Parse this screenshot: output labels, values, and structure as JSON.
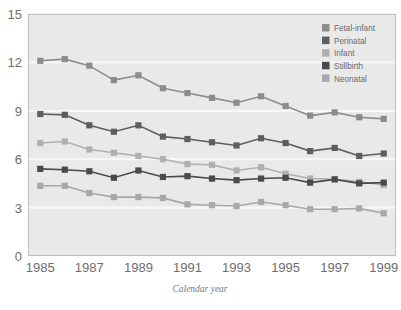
{
  "chart_data": {
    "type": "line",
    "title": "",
    "xlabel": "Calendar year",
    "ylabel": "",
    "x": [
      1985,
      1986,
      1987,
      1988,
      1989,
      1990,
      1991,
      1992,
      1993,
      1994,
      1995,
      1996,
      1997,
      1998,
      1999
    ],
    "xlim": [
      1984.5,
      1999.5
    ],
    "ylim": [
      0,
      15
    ],
    "xticks": [
      1985,
      1987,
      1989,
      1991,
      1993,
      1995,
      1997,
      1999
    ],
    "xtick_labels": [
      "1985",
      "1987",
      "1989",
      "1991",
      "1993",
      "1995",
      "1997",
      "1999"
    ],
    "yticks": [
      0,
      3,
      6,
      9,
      12,
      15
    ],
    "ytick_labels": [
      "0",
      "3",
      "6",
      "9",
      "12",
      "15"
    ],
    "grid": true,
    "grid_axis": "y",
    "legend_position": "top-right",
    "marker": "square",
    "series": [
      {
        "name": "Fetal-infant",
        "color": "#8c8c8c",
        "values": [
          12.1,
          12.2,
          11.8,
          10.9,
          11.2,
          10.4,
          10.1,
          9.8,
          9.5,
          9.9,
          9.3,
          8.7,
          8.9,
          8.6,
          8.5
        ]
      },
      {
        "name": "Perinatal",
        "color": "#5e5e5e",
        "values": [
          8.8,
          8.75,
          8.1,
          7.7,
          8.1,
          7.4,
          7.25,
          7.05,
          6.85,
          7.3,
          7.0,
          6.5,
          6.7,
          6.2,
          6.35
        ]
      },
      {
        "name": "Infant",
        "color": "#b0b0b0",
        "values": [
          7.0,
          7.1,
          6.6,
          6.4,
          6.2,
          6.0,
          5.7,
          5.65,
          5.3,
          5.5,
          5.1,
          4.8,
          4.75,
          4.6,
          4.4
        ]
      },
      {
        "name": "Stillbirth",
        "color": "#4a4a4a",
        "values": [
          5.4,
          5.35,
          5.25,
          4.85,
          5.3,
          4.9,
          4.95,
          4.8,
          4.7,
          4.8,
          4.85,
          4.55,
          4.75,
          4.5,
          4.55
        ]
      },
      {
        "name": "Neonatal",
        "color": "#a8a8a8",
        "values": [
          4.35,
          4.35,
          3.9,
          3.65,
          3.65,
          3.6,
          3.2,
          3.15,
          3.1,
          3.35,
          3.15,
          2.9,
          2.9,
          2.95,
          2.65
        ]
      }
    ]
  },
  "legend": {
    "items": [
      {
        "label": "Fetal-infant",
        "color": "#8c8c8c"
      },
      {
        "label": "Perinatal",
        "color": "#5e5e5e"
      },
      {
        "label": "Infant",
        "color": "#b0b0b0"
      },
      {
        "label": "Stillbirth",
        "color": "#4a4a4a"
      },
      {
        "label": "Neonatal",
        "color": "#a8a8a8"
      }
    ]
  },
  "axis": {
    "x_title": "Calendar year"
  },
  "colors": {
    "plot_background": "#e9e9e9",
    "page_background": "#ffffff",
    "gridline": "#f7f7f7",
    "frame": "#bdbdbd",
    "tick_text": "#6e6e6e",
    "legend_text": "#6a6a6a",
    "axis_title_text": "#7a7a7a"
  }
}
